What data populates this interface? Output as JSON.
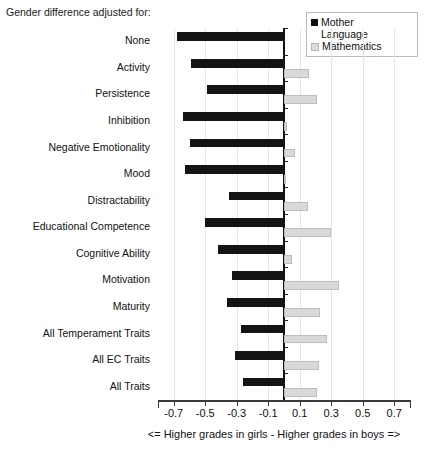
{
  "caption": "Gender difference adjusted for:",
  "legend": {
    "title": "",
    "entries": [
      {
        "label": "Mother\nLanguage",
        "color": "#141414",
        "name": "mother-language"
      },
      {
        "label": "Mathematics",
        "color": "#d9d9d9",
        "name": "mathematics"
      }
    ]
  },
  "xaxis": {
    "title": "<= Higher grades in girls - Higher grades in boys =>",
    "ticks": [
      "-0.7",
      "-0.5",
      "-0.3",
      "-0.1",
      "0.1",
      "0.3",
      "0.5",
      "0.7"
    ],
    "min": -0.7,
    "max": 0.7
  },
  "chart_data": {
    "type": "bar",
    "orientation": "horizontal",
    "title": "Gender difference adjusted for:",
    "xlabel": "<= Higher grades in girls - Higher grades in boys =>",
    "ylabel": "",
    "xlim": [
      -0.7,
      0.7
    ],
    "xticks": [
      -0.7,
      -0.5,
      -0.3,
      -0.1,
      0.1,
      0.3,
      0.5,
      0.7
    ],
    "grid": true,
    "legend_position": "top-right",
    "categories": [
      "None",
      "Activity",
      "Persistence",
      "Inhibition",
      "Negative Emotionality",
      "Mood",
      "Distractability",
      "Educational Competence",
      "Cognitive Ability",
      "Motivation",
      "Maturity",
      "All Temperament Traits",
      "All EC Traits",
      "All Traits"
    ],
    "series": [
      {
        "name": "Mother Language",
        "color": "#141414",
        "values": [
          -0.68,
          -0.59,
          -0.49,
          -0.64,
          -0.6,
          -0.63,
          -0.35,
          -0.5,
          -0.42,
          -0.33,
          -0.36,
          -0.27,
          -0.31,
          -0.26
        ]
      },
      {
        "name": "Mathematics",
        "color": "#d9d9d9",
        "values": [
          0.0,
          0.16,
          0.21,
          0.02,
          0.07,
          0.01,
          0.15,
          0.3,
          0.05,
          0.35,
          0.23,
          0.27,
          0.22,
          0.21
        ]
      }
    ]
  }
}
